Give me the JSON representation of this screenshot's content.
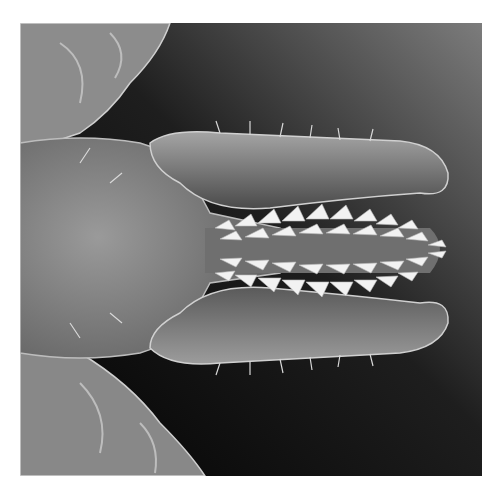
{
  "image": {
    "description": "Grayscale scanning electron micrograph of a tick's mouthparts: central toothed hypostome flanked by two palps, with legs at upper and lower left",
    "colors": {
      "background_dark": "#0a0a0a",
      "background_light": "#7a7a7a",
      "body": "#8a8a8a",
      "teeth": "#f0f0f0",
      "border": "#ffffff"
    }
  }
}
